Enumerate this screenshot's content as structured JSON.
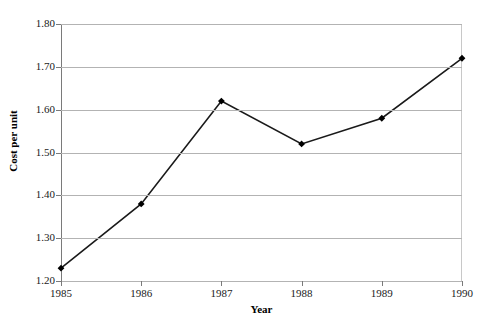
{
  "chart_data": {
    "type": "line",
    "title": "",
    "xlabel": "Year",
    "ylabel": "Cost per unit",
    "categories": [
      "1985",
      "1986",
      "1987",
      "1988",
      "1989",
      "1990"
    ],
    "x": [
      1985,
      1986,
      1987,
      1988,
      1989,
      1990
    ],
    "values": [
      1.23,
      1.38,
      1.62,
      1.52,
      1.58,
      1.72
    ],
    "series": [
      {
        "name": "Cost per unit",
        "values": [
          1.23,
          1.38,
          1.62,
          1.52,
          1.58,
          1.72
        ]
      }
    ],
    "ylim": [
      1.2,
      1.8
    ],
    "ytick_labels": [
      "1.20",
      "1.30",
      "1.40",
      "1.50",
      "1.60",
      "1.70",
      "1.80"
    ],
    "ytick_values": [
      1.2,
      1.3,
      1.4,
      1.5,
      1.6,
      1.7,
      1.8
    ],
    "xtick_labels": [
      "1985",
      "1986",
      "1987",
      "1988",
      "1989",
      "1990"
    ],
    "grid": true,
    "grid_axis": "y",
    "legend": false,
    "legend_position": "none",
    "marker": "diamond",
    "line_color": "#1a1a1a",
    "marker_color": "#000000",
    "grid_color": "#b3b3b3",
    "axis_color": "#7a7a7a",
    "background_color": "#ffffff"
  }
}
